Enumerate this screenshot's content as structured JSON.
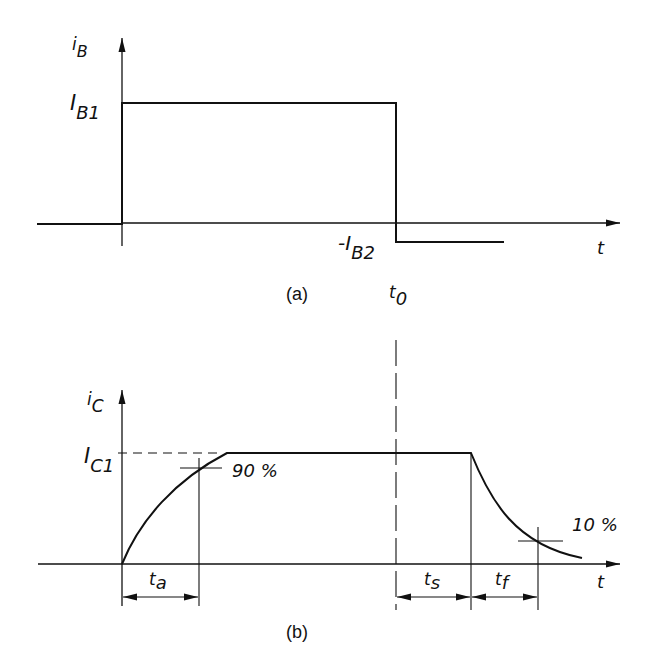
{
  "figure_a": {
    "caption": "(a)",
    "y_label_main": "i",
    "y_label_sub": "B",
    "x_label": "t",
    "level_high_main": "I",
    "level_high_sub": "B1",
    "level_low_main": "-I",
    "level_low_sub": "B2",
    "switch_time_main": "t",
    "switch_time_sub": "0"
  },
  "figure_b": {
    "caption": "(b)",
    "y_label_main": "i",
    "y_label_sub": "C",
    "x_label": "t",
    "level_main": "I",
    "level_sub": "C1",
    "rise_marker": "90 %",
    "fall_marker": "10 %",
    "interval_a_main": "t",
    "interval_a_sub": "a",
    "interval_s_main": "t",
    "interval_s_sub": "s",
    "interval_f_main": "t",
    "interval_f_sub": "f"
  },
  "colors": {
    "line": "#111111",
    "background": "#ffffff"
  }
}
